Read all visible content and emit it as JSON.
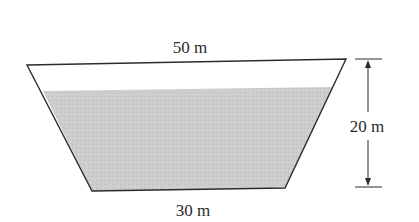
{
  "diagram": {
    "top_width_label": "50 m",
    "bottom_width_label": "30 m",
    "height_label": "20 m",
    "colors": {
      "outline": "#2b2b2b",
      "water_fill": "#c9c9c9",
      "background": "#ffffff",
      "text": "#2a2a2a"
    }
  }
}
